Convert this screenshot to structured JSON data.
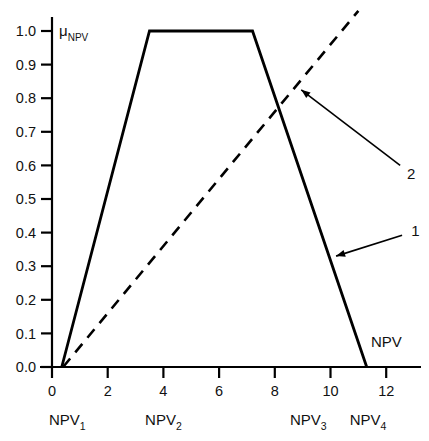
{
  "figure": {
    "background_color": "#ffffff",
    "line_color": "#000000",
    "caption_partial": ""
  },
  "chart_data": {
    "type": "line",
    "title": "",
    "xlabel": "NPV",
    "ylabel": "μ",
    "ylabel_subscript": "NPV",
    "xlim": [
      -0.3,
      13.2
    ],
    "ylim": [
      0.0,
      1.06
    ],
    "grid": false,
    "legend_position": "inline-annotations",
    "x_ticks": [
      0,
      2,
      4,
      6,
      8,
      10,
      12
    ],
    "x_tick_labels": [
      "0",
      "2",
      "4",
      "6",
      "8",
      "10",
      "12"
    ],
    "y_ticks": [
      0.0,
      0.1,
      0.2,
      0.3,
      0.4,
      0.5,
      0.6,
      0.7,
      0.8,
      0.9,
      1.0
    ],
    "y_tick_labels": [
      "0.0",
      "0.1",
      "0.2",
      "0.3",
      "0.4",
      "0.5",
      "0.6",
      "0.7",
      "0.8",
      "0.9",
      "1.0"
    ],
    "series": [
      {
        "name": "1",
        "style": "solid",
        "x": [
          0.35,
          3.5,
          7.2,
          11.3
        ],
        "values": [
          0.0,
          1.0,
          1.0,
          0.0
        ]
      },
      {
        "name": "2",
        "style": "dashed",
        "x": [
          0.4,
          11.0
        ],
        "values": [
          0.0,
          1.06
        ]
      }
    ],
    "annotations": [
      {
        "label": "1",
        "label_x": 13.05,
        "label_y": 0.405,
        "target_x": 10.2,
        "target_y": 0.33
      },
      {
        "label": "2",
        "label_x": 12.9,
        "label_y": 0.575,
        "target_x": 8.95,
        "target_y": 0.825
      }
    ],
    "breakpoint_labels": [
      {
        "text": "NPV",
        "sub": "1",
        "x": 0.55
      },
      {
        "text": "NPV",
        "sub": "2",
        "x": 4.0
      },
      {
        "text": "NPV",
        "sub": "3",
        "x": 9.2
      },
      {
        "text": "NPV",
        "sub": "4",
        "x": 11.35
      }
    ]
  }
}
